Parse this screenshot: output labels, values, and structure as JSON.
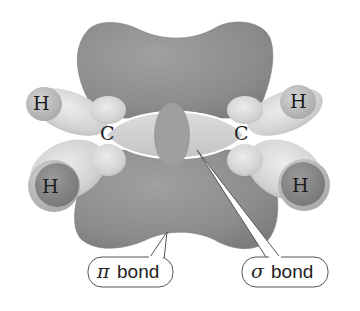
{
  "diagram": {
    "atoms": {
      "carbon_left": "C",
      "carbon_right": "C",
      "hydrogen_top_left": "H",
      "hydrogen_bottom_left": "H",
      "hydrogen_top_right": "H",
      "hydrogen_bottom_right": "H"
    },
    "callouts": {
      "pi": {
        "symbol": "π",
        "label": "bond"
      },
      "sigma": {
        "symbol": "σ",
        "label": "bond"
      }
    },
    "colors": {
      "pi_lobe": "#8e8e8e",
      "pi_lobe_edge": "#7a7a7a",
      "sigma_outer": "#cfcfcf",
      "sigma_inner": "#9a9a9a",
      "hydrogen_light": "#c2c2c2",
      "hydrogen_dark": "#8a8a8a",
      "sp2_lobe": "#d6d6d6",
      "callout_fill": "#ffffff",
      "callout_stroke": "#555555"
    }
  }
}
